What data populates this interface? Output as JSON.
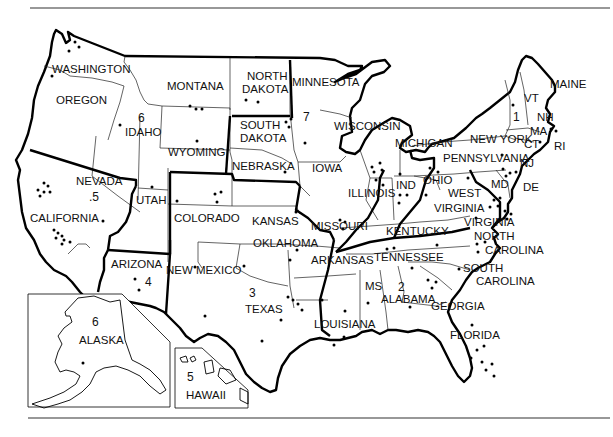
{
  "map": {
    "title": "United States regions map",
    "states": [
      {
        "id": "washington",
        "label": "WASHINGTON",
        "x": 52,
        "y": 73
      },
      {
        "id": "oregon",
        "label": "OREGON",
        "x": 56,
        "y": 104
      },
      {
        "id": "idaho",
        "label": "IDAHO",
        "x": 125,
        "y": 136
      },
      {
        "id": "montana",
        "label": "MONTANA",
        "x": 193,
        "y": 90
      },
      {
        "id": "wyoming",
        "label": "WYOMING",
        "x": 190,
        "y": 156
      },
      {
        "id": "north-dakota",
        "label": "NORTH",
        "x": 247,
        "y": 79
      },
      {
        "id": "north-dakota-2",
        "label": "DAKOTA",
        "x": 242,
        "y": 92
      },
      {
        "id": "south-dakota",
        "label": "SOUTH",
        "x": 240,
        "y": 129
      },
      {
        "id": "south-dakota-2",
        "label": "DAKOTA",
        "x": 240,
        "y": 142
      },
      {
        "id": "minnesota",
        "label": "MINNESOTA",
        "x": 290,
        "y": 86
      },
      {
        "id": "wisconsin",
        "label": "WISCONSIN",
        "x": 334,
        "y": 130
      },
      {
        "id": "michigan",
        "label": "MICHIGAN",
        "x": 395,
        "y": 145
      },
      {
        "id": "nebraska",
        "label": "NEBRASKA",
        "x": 232,
        "y": 168
      },
      {
        "id": "iowa",
        "label": "IOWA",
        "x": 312,
        "y": 170
      },
      {
        "id": "nevada",
        "label": "NEVADA",
        "x": 76,
        "y": 185
      },
      {
        "id": "utah",
        "label": "UTAH",
        "x": 136,
        "y": 202
      },
      {
        "id": "colorado",
        "label": "COLORADO",
        "x": 174,
        "y": 222
      },
      {
        "id": "kansas",
        "label": "KANSAS",
        "x": 251,
        "y": 225
      },
      {
        "id": "missouri",
        "label": "MISSOURI",
        "x": 311,
        "y": 230
      },
      {
        "id": "illinois",
        "label": "ILLINOIS",
        "x": 348,
        "y": 197
      },
      {
        "id": "ind",
        "label": "IND",
        "x": 396,
        "y": 190
      },
      {
        "id": "ohio",
        "label": "OHIO",
        "x": 423,
        "y": 184
      },
      {
        "id": "pennsylvania",
        "label": "PENNSYLVANIA",
        "x": 443,
        "y": 160
      },
      {
        "id": "new-york",
        "label": "NEW YORK",
        "x": 470,
        "y": 141
      },
      {
        "id": "vt",
        "label": "VT",
        "x": 524,
        "y": 100
      },
      {
        "id": "nh",
        "label": "NH",
        "x": 538,
        "y": 119
      },
      {
        "id": "maine",
        "label": "MAINE",
        "x": 551,
        "y": 86
      },
      {
        "id": "ma",
        "label": "MA",
        "x": 531,
        "y": 133
      },
      {
        "id": "ct",
        "label": "CT",
        "x": 524,
        "y": 146
      },
      {
        "id": "ri",
        "label": "RI",
        "x": 554,
        "y": 148
      },
      {
        "id": "nj",
        "label": "NJ",
        "x": 520,
        "y": 164
      },
      {
        "id": "md",
        "label": "MD",
        "x": 491,
        "y": 186
      },
      {
        "id": "de",
        "label": "DE",
        "x": 522,
        "y": 188
      },
      {
        "id": "west-virginia",
        "label": "WEST",
        "x": 448,
        "y": 197
      },
      {
        "id": "west-virginia-2",
        "label": "VIRGINIA",
        "x": 434,
        "y": 212
      },
      {
        "id": "virginia",
        "label": "VIRGINIA",
        "x": 464,
        "y": 226
      },
      {
        "id": "kentucky",
        "label": "KENTUCKY",
        "x": 386,
        "y": 235
      },
      {
        "id": "california",
        "label": "CALIFORNIA",
        "x": 30,
        "y": 222
      },
      {
        "id": "arizona",
        "label": "ARIZONA",
        "x": 110,
        "y": 264
      },
      {
        "id": "new-mexico",
        "label": "NEW MEXICO",
        "x": 165,
        "y": 273
      },
      {
        "id": "oklahoma",
        "label": "OKLAHOMA",
        "x": 253,
        "y": 247
      },
      {
        "id": "arkansas",
        "label": "ARKANSAS",
        "x": 311,
        "y": 264
      },
      {
        "id": "tennessee",
        "label": "TENNESSEE",
        "x": 375,
        "y": 259
      },
      {
        "id": "north-carolina",
        "label": "NORTH",
        "x": 474,
        "y": 243
      },
      {
        "id": "north-carolina-2",
        "label": "CAROLINA",
        "x": 485,
        "y": 257
      },
      {
        "id": "south-carolina",
        "label": "SOUTH",
        "x": 463,
        "y": 271
      },
      {
        "id": "south-carolina-2",
        "label": "CAROLINA",
        "x": 476,
        "y": 285
      },
      {
        "id": "texas",
        "label": "TEXAS",
        "x": 245,
        "y": 311
      },
      {
        "id": "ms",
        "label": "MS",
        "x": 365,
        "y": 289
      },
      {
        "id": "alabama",
        "label": "ALABAMA",
        "x": 381,
        "y": 305
      },
      {
        "id": "georgia",
        "label": "GEORGIA",
        "x": 431,
        "y": 309
      },
      {
        "id": "louisiana",
        "label": "LOUISIANA",
        "x": 314,
        "y": 329
      },
      {
        "id": "florida",
        "label": "FLORIDA",
        "x": 450,
        "y": 339
      },
      {
        "id": "alaska",
        "label": "ALASKA",
        "x": 79,
        "y": 344
      },
      {
        "id": "hawaii",
        "label": "HAWAII",
        "x": 187,
        "y": 398
      }
    ],
    "region_numbers": [
      {
        "id": "region-1",
        "label": "1",
        "x": 513,
        "y": 120
      },
      {
        "id": "region-2",
        "label": "2",
        "x": 398,
        "y": 290
      },
      {
        "id": "region-3",
        "label": "3",
        "x": 249,
        "y": 296
      },
      {
        "id": "region-4",
        "label": "4",
        "x": 147,
        "y": 285
      },
      {
        "id": "region-5",
        "label": ".5",
        "x": 90,
        "y": 200
      },
      {
        "id": "region-5b",
        "label": "5",
        "x": 188,
        "y": 380
      },
      {
        "id": "region-6",
        "label": "6",
        "x": 142,
        "y": 122
      },
      {
        "id": "region-6b",
        "label": "6",
        "x": 95,
        "y": 324
      },
      {
        "id": "region-7",
        "label": "7",
        "x": 305,
        "y": 121
      }
    ]
  }
}
